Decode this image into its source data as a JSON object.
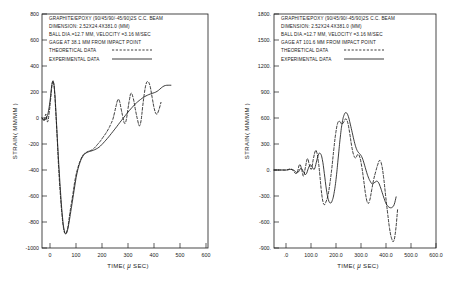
{
  "figure": {
    "background": "#ffffff",
    "ink": "#1a1a1a",
    "panel_count": 2
  },
  "chart_data": [
    {
      "type": "line",
      "panel": "left",
      "title": "",
      "xlabel": "TIME( μ SEC)",
      "ylabel": "STRAIN( MM/MM )",
      "xlim": [
        0,
        600
      ],
      "ylim": [
        -1000,
        800
      ],
      "xticks": [
        0,
        100,
        200,
        300,
        400,
        500,
        600
      ],
      "xtick_labels": [
        "0",
        "100",
        "200",
        "300",
        "400",
        "500",
        "600"
      ],
      "yticks": [
        -1000,
        -800,
        -600,
        -400,
        -200,
        0,
        200,
        400,
        600,
        800
      ],
      "ytick_labels": [
        "-1000",
        "-800",
        "-600",
        "-400",
        "-200",
        "0",
        "200",
        "400",
        "600",
        "800"
      ],
      "grid": false,
      "legend_position": "upper-left-inset",
      "annotations": [
        "GRAPHITE/EPOXY (90/45/90/-45/90)2S C.C. BEAM",
        "DIMENSION: 2.52X24.4X381.0 (MM)",
        "BALL DIA.=12.7 MM, VELOCITY =3.16 M/SEC",
        "GAGE AT 38.1 MM FROM IMPACT POINT"
      ],
      "series": [
        {
          "name": "THEORETICAL DATA",
          "style": "dashed",
          "x": [
            0,
            8,
            14,
            20,
            26,
            31,
            35,
            38,
            42,
            46,
            50,
            55,
            60,
            66,
            72,
            78,
            84,
            90,
            95,
            100,
            106,
            112,
            120,
            130,
            140,
            150,
            160,
            168,
            176,
            184,
            192,
            200,
            210,
            220,
            230,
            240,
            248,
            256,
            262,
            268,
            274,
            280,
            286,
            292,
            298,
            304,
            310,
            316,
            322,
            330,
            338,
            346,
            352,
            358,
            364,
            370,
            376,
            382,
            390,
            398,
            406,
            414,
            422,
            430
          ],
          "y": [
            0,
            -20,
            30,
            -30,
            40,
            140,
            230,
            280,
            270,
            180,
            40,
            -160,
            -380,
            -580,
            -740,
            -850,
            -890,
            -870,
            -820,
            -740,
            -660,
            -580,
            -470,
            -380,
            -320,
            -280,
            -265,
            -255,
            -250,
            -240,
            -225,
            -205,
            -180,
            -150,
            -120,
            -85,
            -50,
            -10,
            40,
            95,
            140,
            130,
            70,
            10,
            -40,
            -20,
            60,
            140,
            190,
            150,
            60,
            -20,
            -60,
            -20,
            90,
            190,
            260,
            280,
            250,
            160,
            70,
            30,
            60,
            120
          ]
        },
        {
          "name": "EXPERIMENTAL DATA",
          "style": "solid",
          "x": [
            0,
            10,
            18,
            24,
            30,
            34,
            38,
            42,
            46,
            50,
            56,
            62,
            68,
            74,
            80,
            86,
            92,
            98,
            104,
            110,
            118,
            126,
            136,
            146,
            156,
            166,
            176,
            186,
            196,
            206,
            216,
            226,
            236,
            246,
            256,
            266,
            276,
            286,
            296,
            306,
            316,
            326,
            336,
            346,
            356,
            366,
            376,
            386,
            396,
            406,
            416,
            426,
            436,
            446,
            456,
            466
          ],
          "y": [
            0,
            -15,
            10,
            60,
            150,
            230,
            275,
            270,
            200,
            60,
            -180,
            -400,
            -600,
            -760,
            -860,
            -890,
            -865,
            -800,
            -720,
            -640,
            -530,
            -430,
            -350,
            -300,
            -275,
            -262,
            -255,
            -248,
            -238,
            -225,
            -205,
            -182,
            -158,
            -132,
            -105,
            -78,
            -50,
            -22,
            5,
            32,
            58,
            82,
            105,
            125,
            142,
            158,
            170,
            180,
            188,
            195,
            205,
            222,
            240,
            250,
            252,
            252
          ]
        }
      ]
    },
    {
      "type": "line",
      "panel": "right",
      "title": "",
      "xlabel": "TIME( μ SEC)",
      "ylabel": "STRAIN( MM/MM )",
      "xlim": [
        -50,
        600
      ],
      "ylim": [
        -900,
        1800
      ],
      "xticks": [
        0,
        100,
        200,
        300,
        400,
        500,
        600
      ],
      "xtick_labels": [
        ".0",
        "100.0",
        "200.0",
        "300.0",
        "400.0",
        "500.0",
        "600.0"
      ],
      "yticks": [
        -900,
        -600,
        -300,
        0,
        300,
        600,
        900,
        1200,
        1500,
        1800
      ],
      "ytick_labels": [
        "-900.",
        "-600.",
        "-300.",
        "0.",
        "300.",
        "600.",
        "900.",
        "1200.",
        "1500.",
        "1800."
      ],
      "grid": false,
      "legend_position": "upper-left-inset",
      "annotations": [
        "GRAPHITE/EPOXY (90/45/90/-45/90)2S C.C. BEAM",
        "DIMENSION: 2.52X24.4X381.0 (MM)",
        "BALL DIA.=12.7 MM, VELOCITY =3.16 M/SEC",
        "GAGE AT 101.6 MM FROM IMPACT POINT"
      ],
      "series": [
        {
          "name": "THEORETICAL DATA",
          "style": "dashed",
          "x": [
            -50,
            -20,
            0,
            20,
            40,
            52,
            60,
            68,
            76,
            84,
            92,
            100,
            108,
            116,
            122,
            128,
            134,
            140,
            146,
            152,
            158,
            166,
            174,
            182,
            190,
            198,
            206,
            214,
            222,
            230,
            238,
            246,
            254,
            262,
            270,
            278,
            286,
            294,
            302,
            310,
            318,
            326,
            334,
            342,
            350,
            358,
            366,
            374,
            382,
            390,
            398,
            406,
            414,
            422,
            430,
            438,
            446
          ],
          "y": [
            0,
            0,
            0,
            10,
            -40,
            60,
            20,
            -70,
            30,
            130,
            60,
            10,
            130,
            220,
            200,
            100,
            -60,
            -240,
            -360,
            -400,
            -370,
            -300,
            -160,
            20,
            240,
            430,
            545,
            560,
            530,
            555,
            590,
            545,
            420,
            270,
            170,
            140,
            180,
            150,
            40,
            -120,
            -290,
            -380,
            -350,
            -230,
            -110,
            -20,
            60,
            110,
            60,
            -90,
            -300,
            -500,
            -680,
            -790,
            -820,
            -700,
            -450
          ]
        },
        {
          "name": "EXPERIMENTAL DATA",
          "style": "solid",
          "x": [
            -50,
            -20,
            0,
            24,
            44,
            58,
            68,
            78,
            88,
            96,
            104,
            112,
            120,
            128,
            136,
            144,
            152,
            160,
            168,
            176,
            184,
            192,
            200,
            208,
            216,
            224,
            232,
            240,
            248,
            256,
            264,
            272,
            280,
            288,
            296,
            304,
            312,
            320,
            328,
            336,
            344,
            352,
            360,
            368,
            376,
            384,
            392,
            400,
            408,
            416,
            424,
            432,
            440
          ],
          "y": [
            0,
            0,
            0,
            5,
            -30,
            20,
            -20,
            -50,
            20,
            60,
            30,
            10,
            90,
            175,
            190,
            120,
            -40,
            -220,
            -340,
            -380,
            -350,
            -250,
            -80,
            150,
            380,
            550,
            640,
            660,
            620,
            530,
            430,
            330,
            250,
            205,
            180,
            140,
            70,
            -10,
            -80,
            -130,
            -160,
            -150,
            -130,
            -140,
            -190,
            -260,
            -330,
            -390,
            -420,
            -435,
            -430,
            -400,
            -310
          ]
        }
      ]
    }
  ]
}
